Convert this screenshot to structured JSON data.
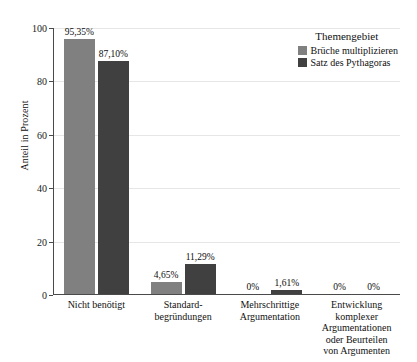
{
  "chart_data": {
    "type": "bar",
    "title": "",
    "subtitle": "",
    "xlabel": "",
    "ylabel": "Anteil in Prozent",
    "ylim": [
      0,
      100
    ],
    "yticks": [
      0,
      20,
      40,
      60,
      80,
      100
    ],
    "ytick_labels": [
      "0",
      "20",
      "40",
      "60",
      "80",
      "100"
    ],
    "grid": "horizontal",
    "legend_position": "top-right-inside",
    "legend_title": "Themengebiet",
    "categories": [
      "Nicht benötigt",
      "Standard-\nbegründungen",
      "Mehrschrittige\nArgumentation",
      "Entwicklung\nkomplexer\nArgumentationen\noder Beurteilen\nvon Argumenten"
    ],
    "category_lines": [
      [
        "Nicht benötigt"
      ],
      [
        "Standard-",
        "begründungen"
      ],
      [
        "Mehrschrittige",
        "Argumentation"
      ],
      [
        "Entwicklung",
        "komplexer",
        "Argumentationen",
        "oder Beurteilen",
        "von Argumenten"
      ]
    ],
    "series": [
      {
        "name": "Brüche multiplizieren",
        "color": "#808080",
        "values": [
          95.35,
          4.65,
          0,
          0
        ],
        "labels": [
          "95,35%",
          "4,65%",
          "0%",
          "0%"
        ]
      },
      {
        "name": "Satz des Pythagoras",
        "color": "#404040",
        "values": [
          87.1,
          11.29,
          1.61,
          0
        ],
        "labels": [
          "87,10%",
          "11,29%",
          "1,61%",
          "0%"
        ]
      }
    ]
  }
}
